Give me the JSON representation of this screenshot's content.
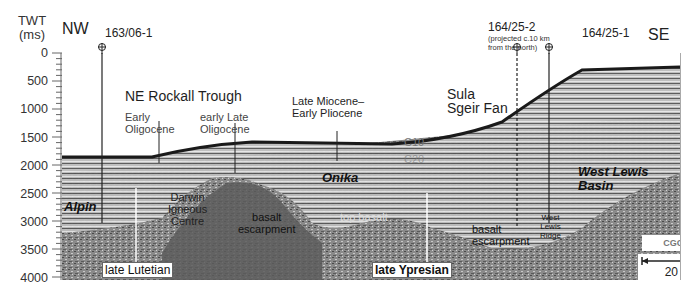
{
  "axis": {
    "title_line1": "TWT",
    "title_line2": "(ms)",
    "ticks": [
      "0",
      "500",
      "1000",
      "1500",
      "2000",
      "2500",
      "3000",
      "3500",
      "4000"
    ]
  },
  "directions": {
    "left": "NW",
    "right": "SE"
  },
  "wells": [
    {
      "name": "163/06-1",
      "style": "solid"
    },
    {
      "name": "164/25-2",
      "note_line1": "(projected c.10 km",
      "note_line2": "from the north)",
      "style": "dashed"
    },
    {
      "name": "164/25-1",
      "style": "solid"
    }
  ],
  "labels": {
    "ne_rockall_trough": "NE Rockall Trough",
    "early_oligocene_1": "Early",
    "early_oligocene_2": "Oligocene",
    "early_late_oligocene_1": "early Late",
    "early_late_oligocene_2": "Oligocene",
    "late_miocene_1": "Late Miocene–",
    "late_miocene_2": "Early Pliocene",
    "sula_sgeir_1": "Sula",
    "sula_sgeir_2": "Sgeir Fan",
    "c10": "C10",
    "c20": "C20",
    "alpin": "Alpin",
    "darwin_1": "Darwin",
    "darwin_2": "Igneous",
    "darwin_3": "Centre",
    "onika": "Onika",
    "basalt_escarpment_1a": "basalt",
    "basalt_escarpment_1b": "escarpment",
    "top_basalt": "top basalt",
    "basalt_escarpment_2a": "basalt",
    "basalt_escarpment_2b": "escarpment",
    "west_lewis_basin_1": "West Lewis",
    "west_lewis_basin_2": "Basin",
    "west_lewis_ridge_1": "West",
    "west_lewis_ridge_2": "Lewis",
    "west_lewis_ridge_3": "Ridge",
    "late_lutetian": "late Lutetian",
    "late_ypresian": "late Ypresian"
  },
  "logo": {
    "text": "CGGVERITAS"
  },
  "scale_bar": {
    "label": "20 km"
  },
  "colors": {
    "seafloor": "#1a1a1a",
    "sediment": "#b8b8b8",
    "basement": "#6e6e6e",
    "background": "#ffffff"
  }
}
